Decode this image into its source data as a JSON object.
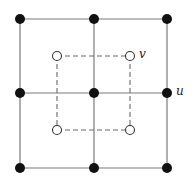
{
  "diagram": {
    "type": "grid-graph-with-dual",
    "colors": {
      "solid_edge": "#7a7a7a",
      "dashed_edge": "#6a6a6a",
      "filled_node": "#111111",
      "open_node_fill": "#ffffff",
      "open_node_stroke": "#333333"
    },
    "labels": {
      "u": "u",
      "v": "v"
    },
    "filled_nodes": [
      {
        "id": "a1",
        "x": 20,
        "y": 19
      },
      {
        "id": "a2",
        "x": 94,
        "y": 19
      },
      {
        "id": "a3",
        "x": 167,
        "y": 19
      },
      {
        "id": "b1",
        "x": 20,
        "y": 93
      },
      {
        "id": "b2",
        "x": 94,
        "y": 93
      },
      {
        "id": "u",
        "x": 167,
        "y": 93
      },
      {
        "id": "c1",
        "x": 20,
        "y": 168
      },
      {
        "id": "c2",
        "x": 94,
        "y": 168
      },
      {
        "id": "c3",
        "x": 167,
        "y": 168
      }
    ],
    "open_nodes": [
      {
        "id": "d1",
        "x": 57,
        "y": 56
      },
      {
        "id": "v",
        "x": 130,
        "y": 56
      },
      {
        "id": "d3",
        "x": 57,
        "y": 130
      },
      {
        "id": "d4",
        "x": 130,
        "y": 130
      }
    ]
  }
}
